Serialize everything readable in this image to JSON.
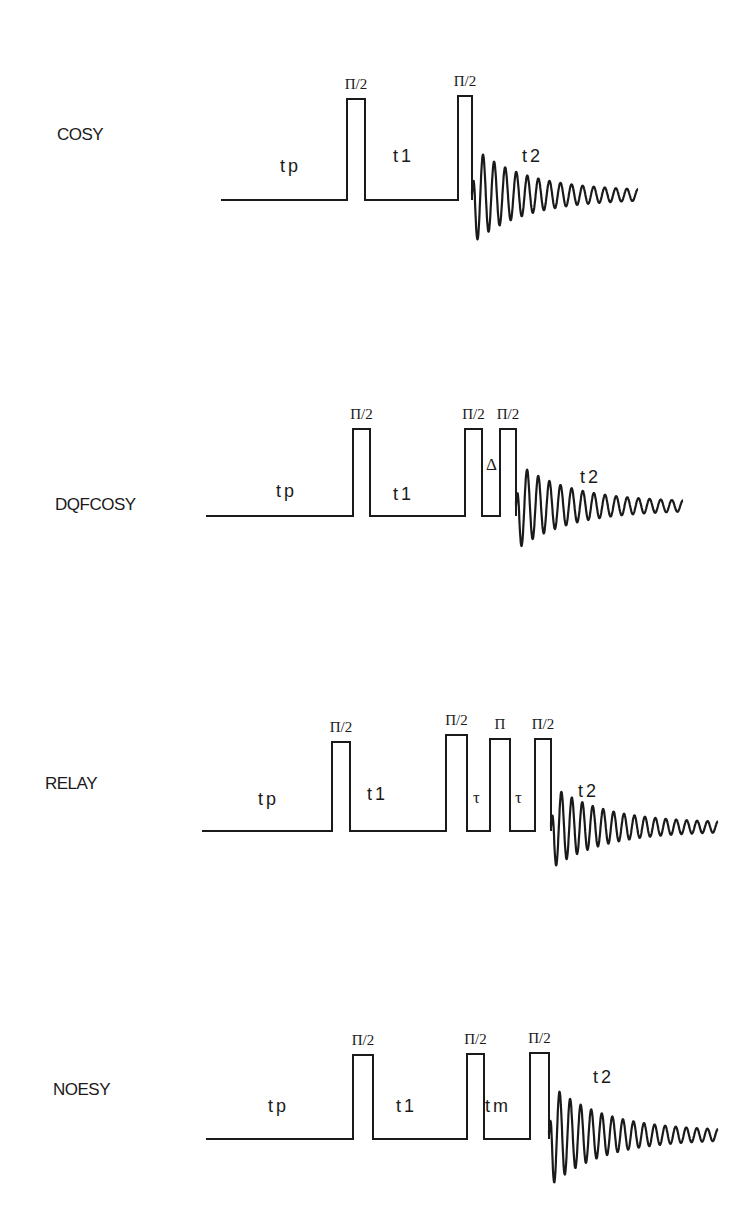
{
  "figure": {
    "colors": {
      "ink": "#1a1a1a",
      "background": "#ffffff"
    }
  },
  "sequences": [
    {
      "name": "COSY",
      "label_pos": [
        57,
        140
      ],
      "baseline_y": 200,
      "start_x": 221,
      "pulses": [
        {
          "label": "Π/2",
          "x1": 347,
          "x2": 365,
          "top": 99
        },
        {
          "label": "Π/2",
          "x1": 458,
          "x2": 472,
          "top": 96
        }
      ],
      "delays": [
        {
          "label": "tp",
          "x": 280,
          "y": 172,
          "kind": "text"
        },
        {
          "label": "t1",
          "x": 393,
          "y": 162,
          "kind": "text"
        }
      ],
      "fid": {
        "label": "t2",
        "label_x": 522,
        "label_y": 162,
        "x_start": 472,
        "x_end": 638,
        "center_y": 195,
        "amp": 45,
        "cycles": 15
      }
    },
    {
      "name": "DQFCOSY",
      "label_pos": [
        55,
        510
      ],
      "baseline_y": 516,
      "start_x": 206,
      "pulses": [
        {
          "label": "Π/2",
          "x1": 353,
          "x2": 370,
          "top": 429
        },
        {
          "label": "Π/2",
          "x1": 465,
          "x2": 482,
          "top": 429
        },
        {
          "label": "Π/2",
          "x1": 500,
          "x2": 516,
          "top": 429
        }
      ],
      "delays": [
        {
          "label": "tp",
          "x": 276,
          "y": 497,
          "kind": "text"
        },
        {
          "label": "t1",
          "x": 393,
          "y": 500,
          "kind": "text"
        },
        {
          "label": "Δ",
          "x": 486,
          "y": 470,
          "kind": "greek"
        }
      ],
      "fid": {
        "label": "t2",
        "label_x": 580,
        "label_y": 483,
        "x_start": 516,
        "x_end": 683,
        "center_y": 506,
        "amp": 40,
        "cycles": 15
      }
    },
    {
      "name": "RELAY",
      "label_pos": [
        45,
        789
      ],
      "baseline_y": 831,
      "start_x": 202,
      "pulses": [
        {
          "label": "Π/2",
          "x1": 332,
          "x2": 350,
          "top": 742
        },
        {
          "label": "Π/2",
          "x1": 446,
          "x2": 467,
          "top": 735
        },
        {
          "label": "Π",
          "x1": 490,
          "x2": 510,
          "top": 739
        },
        {
          "label": "Π/2",
          "x1": 535,
          "x2": 551,
          "top": 739
        }
      ],
      "delays": [
        {
          "label": "tp",
          "x": 258,
          "y": 805,
          "kind": "text"
        },
        {
          "label": "t1",
          "x": 367,
          "y": 800,
          "kind": "text"
        },
        {
          "label": "τ",
          "x": 473,
          "y": 803,
          "kind": "greek"
        },
        {
          "label": "τ",
          "x": 515,
          "y": 803,
          "kind": "greek"
        }
      ],
      "fid": {
        "label": "t2",
        "label_x": 578,
        "label_y": 797,
        "x_start": 551,
        "x_end": 718,
        "center_y": 827,
        "amp": 38,
        "cycles": 16
      }
    },
    {
      "name": "NOESY",
      "label_pos": [
        53,
        1095
      ],
      "baseline_y": 1139,
      "start_x": 206,
      "pulses": [
        {
          "label": "Π/2",
          "x1": 353,
          "x2": 373,
          "top": 1055
        },
        {
          "label": "Π/2",
          "x1": 467,
          "x2": 484,
          "top": 1054
        },
        {
          "label": "Π/2",
          "x1": 530,
          "x2": 549,
          "top": 1053
        }
      ],
      "delays": [
        {
          "label": "tp",
          "x": 268,
          "y": 1112,
          "kind": "text"
        },
        {
          "label": "t1",
          "x": 396,
          "y": 1112,
          "kind": "text"
        },
        {
          "label": "tm",
          "x": 485,
          "y": 1112,
          "kind": "text"
        }
      ],
      "fid": {
        "label": "t2",
        "label_x": 593,
        "label_y": 1083,
        "x_start": 549,
        "x_end": 718,
        "center_y": 1135,
        "amp": 48,
        "cycles": 16
      }
    }
  ]
}
